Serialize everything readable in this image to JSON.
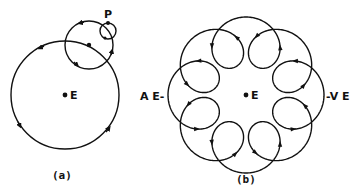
{
  "figure": {
    "panel_a": {
      "caption": "(a)",
      "center_label": "E",
      "point_label": "P",
      "deferent": {
        "cx": 65,
        "cy": 95,
        "r": 54
      },
      "epicycle": {
        "cx": 89,
        "cy": 45,
        "r": 24
      },
      "small_epicycle": {
        "cx": 108,
        "cy": 31,
        "r": 8
      }
    },
    "panel_b": {
      "caption": "(b)",
      "center_label": "E",
      "left_label": "A E-",
      "right_label": "-V E",
      "loops": 8
    },
    "colors": {
      "ink": "#111111",
      "background": "#ffffff"
    }
  }
}
